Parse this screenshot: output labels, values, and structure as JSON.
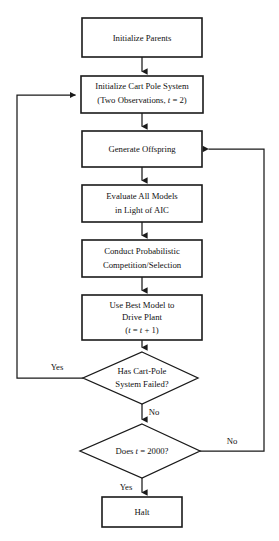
{
  "diagram": {
    "type": "flowchart",
    "background_color": "#ffffff",
    "line_color": "#1a1a1a",
    "text_color": "#111111",
    "nodes": [
      {
        "id": "initialize-parents",
        "shape": "rectangle",
        "lines": [
          "Initialize Parents"
        ]
      },
      {
        "id": "initialize-cart-pole",
        "shape": "rectangle",
        "lines": [
          "Initialize Cart Pole System",
          "(Two Observations, t = 2)"
        ],
        "line1": "Initialize Cart Pole System",
        "line2_pre": "(Two Observations, ",
        "line2_var": "t",
        "line2_post": " = 2)"
      },
      {
        "id": "generate-offspring",
        "shape": "rectangle",
        "lines": [
          "Generate Offspring"
        ]
      },
      {
        "id": "evaluate-models",
        "shape": "rectangle",
        "lines": [
          "Evaluate All Models",
          "in Light of AIC"
        ],
        "line1": "Evaluate All Models",
        "line2": "in Light of AIC"
      },
      {
        "id": "conduct-competition",
        "shape": "rectangle",
        "lines": [
          "Conduct Probabilistic",
          "Competition/Selection"
        ],
        "line1": "Conduct Probabilistic",
        "line2": "Competition/Selection"
      },
      {
        "id": "use-best-model",
        "shape": "rectangle",
        "lines": [
          "Use Best Model to",
          "Drive Plant",
          "(t = t + 1)"
        ],
        "line1": "Use Best Model to",
        "line2": "Drive Plant",
        "line3_open": "(",
        "line3_var1": "t",
        "line3_mid": " = ",
        "line3_var2": "t",
        "line3_close": " + 1)"
      },
      {
        "id": "has-cart-pole-failed",
        "shape": "diamond",
        "lines": [
          "Has Cart-Pole",
          "System Failed?"
        ],
        "line1": "Has Cart-Pole",
        "line2": "System Failed?"
      },
      {
        "id": "does-t-equal-2000",
        "shape": "diamond",
        "lines": [
          "Does t = 2000?"
        ],
        "line_pre": "Does ",
        "line_var": "t",
        "line_post": " = 2000?"
      },
      {
        "id": "halt",
        "shape": "rectangle",
        "lines": [
          "Halt"
        ]
      }
    ],
    "edge_labels": {
      "failed_yes": "Yes",
      "failed_no": "No",
      "t2000_no": "No",
      "t2000_yes": "Yes"
    }
  }
}
